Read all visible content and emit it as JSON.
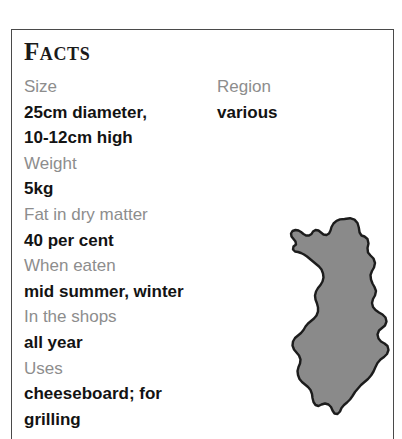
{
  "panel": {
    "heading": "Facts",
    "border_color": "#4a4a4a",
    "background_color": "#ffffff"
  },
  "colors": {
    "label": "#8d8d8d",
    "value": "#131313",
    "heading": "#1a1a1a",
    "map_fill": "#8a8a8a",
    "map_outline": "#1c1c1c"
  },
  "facts": {
    "left_column": [
      {
        "label": "Size",
        "value": "25cm diameter,\n10-12cm high"
      },
      {
        "label": "Weight",
        "value": "5kg"
      },
      {
        "label": "Fat in dry matter",
        "value": "40 per cent"
      },
      {
        "label": "When eaten",
        "value": "mid summer, winter"
      },
      {
        "label": "In the shops",
        "value": "all year"
      },
      {
        "label": "Uses",
        "value": "cheeseboard; for\ngrilling"
      }
    ],
    "right_column": [
      {
        "label": "Region",
        "value": "various"
      }
    ]
  },
  "map": {
    "name": "finland-map",
    "region": "Finland"
  }
}
